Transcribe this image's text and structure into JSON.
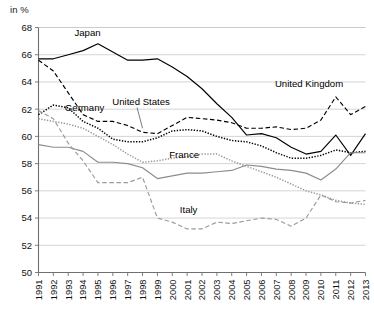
{
  "axis_unit_label": "in %",
  "chart_data": {
    "type": "line",
    "title": "",
    "subtitle": "",
    "xlabel": "",
    "ylabel": "in %",
    "ylim": [
      50,
      68
    ],
    "xlim": [
      1991,
      2013
    ],
    "ytick_step": 2,
    "grid": true,
    "legend_position": "inline-annotations",
    "ytick_labels": [
      "50",
      "52",
      "54",
      "56",
      "58",
      "60",
      "62",
      "64",
      "66",
      "68"
    ],
    "categories": [
      "1991",
      "1992",
      "1993",
      "1994",
      "1995",
      "1996",
      "1997",
      "1998",
      "1999",
      "2000",
      "2001",
      "2002",
      "2003",
      "2004",
      "2005",
      "2006",
      "2007",
      "2008",
      "2009",
      "2010",
      "2011",
      "2012",
      "2013"
    ],
    "x": [
      1991,
      1992,
      1993,
      1994,
      1995,
      1996,
      1997,
      1998,
      1999,
      2000,
      2001,
      2002,
      2003,
      2004,
      2005,
      2006,
      2007,
      2008,
      2009,
      2010,
      2011,
      2012,
      2013
    ],
    "series": [
      {
        "name": "Japan",
        "color": "#000000",
        "style": "solid",
        "label_x": 1994.3,
        "label_y": 67.4,
        "values": [
          65.7,
          65.7,
          66.0,
          66.3,
          66.8,
          66.2,
          65.6,
          65.6,
          65.7,
          65.1,
          64.4,
          63.5,
          62.4,
          61.4,
          60.1,
          60.2,
          59.9,
          59.2,
          58.7,
          58.9,
          60.1,
          58.6,
          60.2
        ]
      },
      {
        "name": "United Kingdom",
        "color": "#000000",
        "style": "dashed",
        "label_x": 2009.2,
        "label_y": 63.6,
        "values": [
          65.6,
          64.8,
          63.2,
          61.6,
          61.1,
          61.1,
          60.8,
          60.3,
          60.2,
          60.8,
          61.4,
          61.3,
          61.2,
          61.0,
          60.6,
          60.6,
          60.7,
          60.5,
          60.6,
          61.2,
          62.9,
          61.6,
          62.2
        ]
      },
      {
        "name": "Germany",
        "color": "#000000",
        "style": "dotted",
        "label_x": 1994.1,
        "label_y": 61.9,
        "values": [
          61.6,
          62.3,
          62.1,
          61.1,
          60.6,
          59.8,
          59.6,
          59.6,
          59.9,
          60.4,
          60.5,
          60.4,
          60.0,
          59.7,
          59.6,
          59.3,
          58.8,
          58.4,
          58.4,
          58.6,
          59.0,
          58.8,
          58.9
        ]
      },
      {
        "name": "United States",
        "color": "#9a9a9a",
        "style": "dotted",
        "label_x": 1997.9,
        "label_y": 62.3,
        "leader_to_x": 1998.0,
        "leader_to_y": 60.6,
        "values": [
          61.3,
          61.1,
          60.9,
          60.6,
          60.0,
          59.4,
          58.7,
          58.1,
          58.2,
          58.4,
          58.5,
          58.7,
          58.7,
          58.2,
          57.8,
          57.4,
          57.0,
          56.5,
          56.0,
          55.7,
          55.3,
          55.1,
          55.0
        ]
      },
      {
        "name": "France",
        "color": "#8c8c8c",
        "style": "solid",
        "label_x": 2000.8,
        "label_y": 58.4,
        "values": [
          59.4,
          59.2,
          59.2,
          58.9,
          58.1,
          58.1,
          58.0,
          57.7,
          56.9,
          57.1,
          57.3,
          57.3,
          57.4,
          57.5,
          57.9,
          57.8,
          57.6,
          57.5,
          57.3,
          56.8,
          57.6,
          58.8,
          58.8
        ]
      },
      {
        "name": "Italy",
        "color": "#9a9a9a",
        "style": "dashed",
        "label_x": 2001.1,
        "label_y": 54.4,
        "values": [
          61.9,
          61.3,
          59.5,
          58.2,
          56.6,
          56.6,
          56.6,
          57.0,
          54.0,
          53.7,
          53.2,
          53.2,
          53.7,
          53.6,
          53.8,
          54.0,
          53.9,
          53.4,
          54.0,
          55.7,
          55.2,
          55.1,
          55.3
        ]
      }
    ]
  }
}
